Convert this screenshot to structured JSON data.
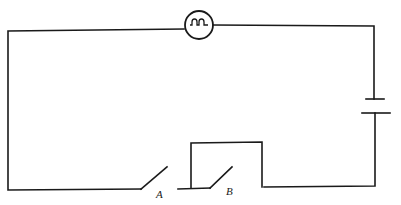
{
  "diagram": {
    "type": "circuit",
    "components": {
      "lamp": {
        "name": "bulb",
        "position": "top-center"
      },
      "battery": {
        "name": "cell",
        "position": "right-side"
      },
      "switch_a": {
        "label": "A",
        "state": "open",
        "position": "bottom-left"
      },
      "switch_b": {
        "label": "B",
        "state": "open",
        "position": "bottom-center",
        "bypassed_by": "wire loop"
      }
    },
    "colors": {
      "line": "#1a1a1a",
      "background": "#ffffff"
    }
  }
}
